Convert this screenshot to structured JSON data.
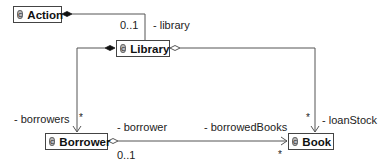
{
  "diagram": {
    "type": "UML class diagram",
    "classes": [
      {
        "id": "action",
        "name": "Action",
        "icon": "class-icon",
        "icon_glyph": "C"
      },
      {
        "id": "library",
        "name": "Library",
        "icon": "class-icon",
        "icon_glyph": "C"
      },
      {
        "id": "borrower",
        "name": "Borrower",
        "icon": "class-icon",
        "icon_glyph": "C"
      },
      {
        "id": "book",
        "name": "Book",
        "icon": "class-icon",
        "icon_glyph": "C"
      }
    ],
    "associations": [
      {
        "from": "Action",
        "to": "Library",
        "kind": "composition",
        "role": "- library",
        "multiplicity": "0..1"
      },
      {
        "from": "Library",
        "to": "Borrower",
        "kind": "composition",
        "role": "- borrowers",
        "multiplicity": "*"
      },
      {
        "from": "Library",
        "to": "Book",
        "kind": "aggregation",
        "role": "- loanStock",
        "multiplicity": "*"
      },
      {
        "from": "Borrower",
        "to": "Book",
        "kind": "aggregation",
        "role": "- borrowedBooks",
        "multiplicity": "*",
        "source_role": "- borrower",
        "source_multiplicity": "0..1"
      }
    ]
  },
  "colors": {
    "line": "#555555",
    "box_border": "#444444",
    "icon_fill": "#bbbbbb"
  }
}
